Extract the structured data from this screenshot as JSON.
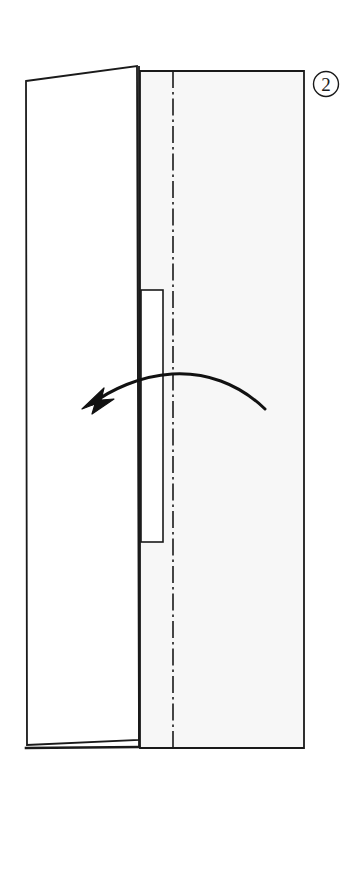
{
  "figure": {
    "kind": "folding-instruction-diagram",
    "step_label": "2",
    "step_label_display": "②",
    "caption": "",
    "background_color": "#ffffff",
    "line_color": "#1a1a1a",
    "panel_fill": "#f7f7f7",
    "flap_fill": "#ffffff",
    "inner_rect_fill": "#ffffff",
    "arrow_color": "#111111"
  },
  "shapes": {
    "main_panel": {
      "name": "main-panel",
      "description": "large tall rectangular panel, faint gray fill",
      "points": "140,71 304,71 304,748 140,748",
      "fill": "#f7f7f7",
      "stroke": "#1a1a1a",
      "stroke_width": 1.8
    },
    "left_flap": {
      "name": "left-flap",
      "description": "hinged flap on left side, white, top edge slanted upward to the right",
      "points": "26,81 137,66 139,740 27,745",
      "fill": "#ffffff",
      "stroke": "#1a1a1a",
      "stroke_width": 1.8
    },
    "flap_bottom_shadow": {
      "name": "flap-bottom-shadow-line",
      "description": "second heavier line along the bottom edge of the flap giving thickness",
      "x1": 27,
      "y1": 748,
      "x2": 139,
      "y2": 747,
      "stroke": "#1a1a1a",
      "stroke_width": 2.6
    },
    "inner_rect": {
      "name": "inner-tab-rectangle",
      "description": "narrow vertical rectangle tab behind the flap edge",
      "x": 141,
      "y": 290,
      "width": 22,
      "height": 252,
      "fill": "#ffffff",
      "stroke": "#1a1a1a",
      "stroke_width": 1.6
    },
    "center_fold_line": {
      "name": "center-fold-line",
      "description": "vertical dash-dot center line marking the fold axis",
      "x": 173,
      "y1": 71,
      "y2": 748,
      "stroke": "#1a1a1a",
      "stroke_width": 1.6,
      "dash_pattern": "17 4 2.5 4"
    },
    "flap_right_edge": {
      "name": "flap-right-edge-line",
      "description": "vertical line at right side of the flap over the panel",
      "x": 139,
      "y1": 66,
      "y2": 747,
      "stroke": "#1a1a1a",
      "stroke_width": 1.8
    }
  },
  "arrow": {
    "name": "fold-direction-arrow",
    "description": "curved arrow sweeping from lower right up over the fold line and down to the left, indicating the panel folds to the left",
    "direction": "right-to-left",
    "path": "M 265 409 C 238 383 205 372 172 374 C 140 376 110 390 92 404",
    "tip": {
      "x": 82,
      "y": 408
    },
    "tail": {
      "x": 265,
      "y": 409
    },
    "apex": {
      "x": 172,
      "y": 374
    },
    "stroke_width": 3.0,
    "head_polygon": "82,409 104,388 101,400 114,399 92,414 95,404"
  },
  "step_badge": {
    "name": "step-number-badge",
    "label": "2",
    "glyph": "②",
    "center_x": 326,
    "center_y": 84,
    "radius": 12.5,
    "stroke": "#1a1a1a",
    "stroke_width": 1.4
  }
}
